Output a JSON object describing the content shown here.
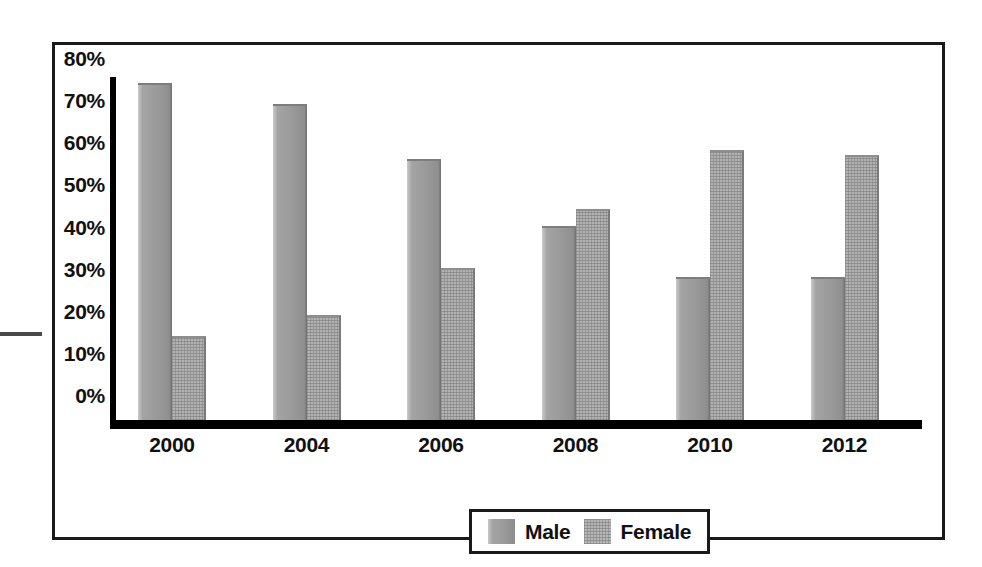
{
  "chart_data": {
    "type": "bar",
    "title": "",
    "subtitle": "",
    "xlabel": "",
    "ylabel": "",
    "categories": [
      "2000",
      "2004",
      "2006",
      "2008",
      "2010",
      "2012"
    ],
    "series": [
      {
        "name": "Male",
        "values": [
          80,
          75,
          62,
          46,
          34,
          34
        ]
      },
      {
        "name": "Female",
        "values": [
          20,
          25,
          36,
          50,
          64,
          63
        ]
      }
    ],
    "ylim": [
      0,
      80
    ],
    "y_ticks": [
      "0%",
      "10%",
      "20%",
      "30%",
      "40%",
      "50%",
      "60%",
      "70%",
      "80%"
    ],
    "y_tick_values": [
      0,
      10,
      20,
      30,
      40,
      50,
      60,
      70,
      80
    ],
    "grid": false,
    "legend_position": "bottom-center",
    "legend": [
      "Male",
      "Female"
    ],
    "annotations": [],
    "colors": {
      "male": "#9a9a9a",
      "female": "#b2b2b2",
      "axis": "#000000",
      "frame": "#1a1a1a",
      "text": "#111111",
      "background": "#ffffff"
    }
  }
}
